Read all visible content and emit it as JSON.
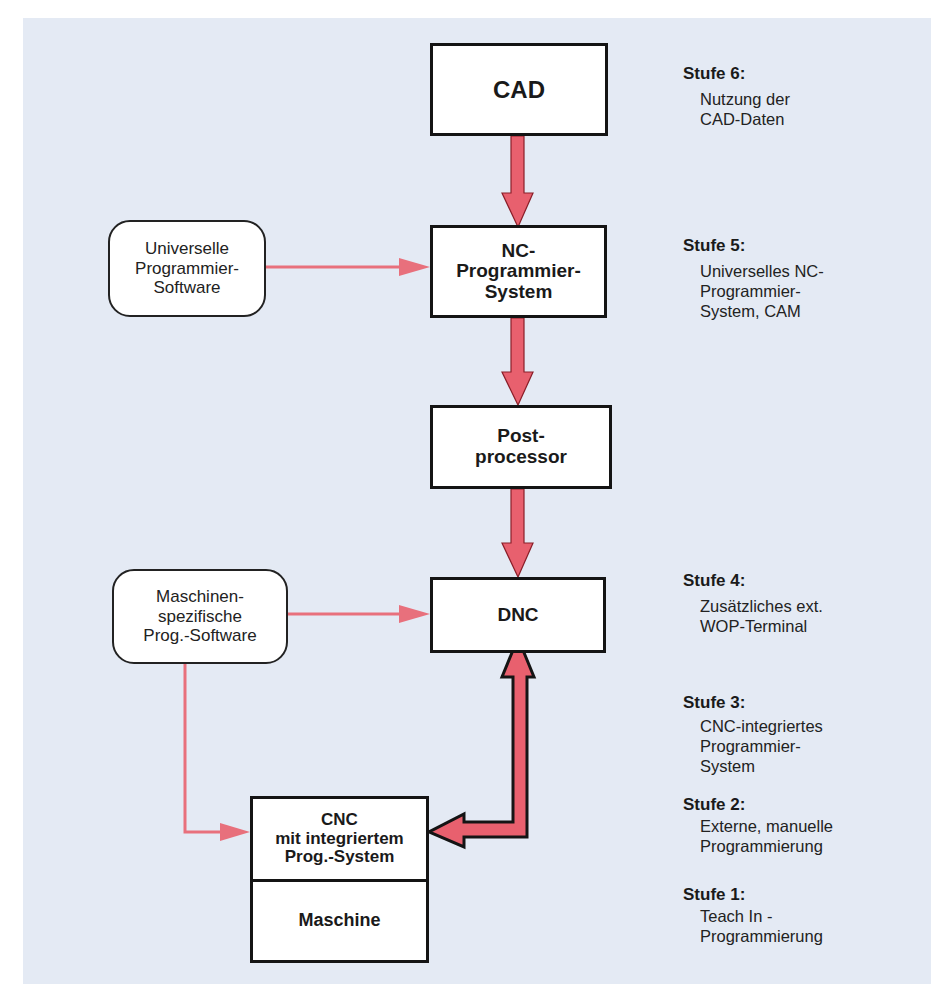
{
  "colors": {
    "background_panel": "#e4eaf4",
    "arrow_fill": "#e8606e",
    "arrow_stroke": "#8a1e28",
    "connector_line": "#e8707c",
    "box_border": "#141414"
  },
  "flow_boxes": {
    "cad": "CAD",
    "nc_system": "NC-\nProgrammier-\nSystem",
    "postprocessor": "Post-\nprocessor",
    "dnc": "DNC",
    "cnc": "CNC\nmit integriertem\nProg.-System",
    "machine": "Maschine"
  },
  "input_boxes": {
    "universal_software": "Universelle\nProgrammier-\nSoftware",
    "machine_specific_software": "Maschinen-\nspezifische\nProg.-Software"
  },
  "stages": [
    {
      "title": "Stufe 6:",
      "description": "Nutzung der\nCAD-Daten"
    },
    {
      "title": "Stufe 5:",
      "description": "Universelles NC-\nProgrammier-\nSystem, CAM"
    },
    {
      "title": "Stufe 4:",
      "description": "Zusätzliches ext.\nWOP-Terminal"
    },
    {
      "title": "Stufe 3:",
      "description": "CNC-integriertes\nProgrammier-\nSystem"
    },
    {
      "title": "Stufe 2:",
      "description": "Externe, manuelle\nProgrammierung"
    },
    {
      "title": "Stufe 1:",
      "description": "Teach In -\nProgrammierung"
    }
  ],
  "connections": [
    {
      "from": "CAD",
      "to": "NC-Programmier-System",
      "style": "thick-arrow"
    },
    {
      "from": "NC-Programmier-System",
      "to": "Postprocessor",
      "style": "thick-arrow"
    },
    {
      "from": "Postprocessor",
      "to": "DNC",
      "style": "thick-arrow"
    },
    {
      "from": "DNC",
      "to": "CNC mit integriertem Prog.-System",
      "style": "thick-bidirectional-arrow"
    },
    {
      "from": "Universelle Programmier-Software",
      "to": "NC-Programmier-System",
      "style": "thin-arrow"
    },
    {
      "from": "Maschinenspezifische Prog.-Software",
      "to": "DNC",
      "style": "thin-arrow"
    },
    {
      "from": "Maschinenspezifische Prog.-Software",
      "to": "CNC mit integriertem Prog.-System",
      "style": "thin-arrow"
    }
  ]
}
